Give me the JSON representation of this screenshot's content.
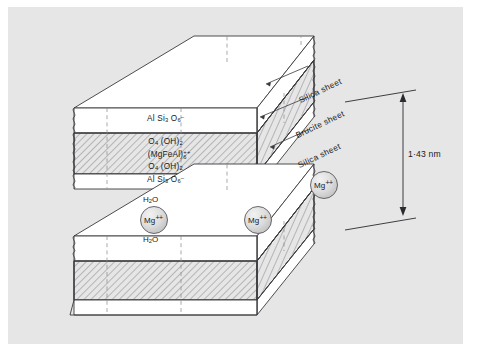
{
  "figure": {
    "background_color": "#e6e6e6",
    "line_color": "#3a3a3f",
    "hatch_color": "#6e6e73",
    "text_color": "#19191c"
  },
  "top_slab": {
    "layers": [
      {
        "id": "silica-upper",
        "fill": "white",
        "formula_lines": [
          "AlSi3O6-"
        ]
      },
      {
        "id": "brucite",
        "fill": "hatched",
        "formula_lines": [
          "O4(OH)2",
          "(MgFeAl)6++",
          "O4(OH)2"
        ]
      },
      {
        "id": "silica-lower",
        "fill": "white",
        "formula_lines": [
          "AlSi3O6-"
        ]
      }
    ],
    "formulas": {
      "silica_top": {
        "a": "Al Si",
        "a_sub": "3",
        "b": " O",
        "b_sub": "6",
        "b_sup": "–"
      },
      "brucite_line1": {
        "a": "O",
        "a_sub": "4",
        "b": " (OH)",
        "b_sub": "2"
      },
      "brucite_line2": {
        "a": "(MgFeAl)",
        "sub": "6",
        "sup": "++"
      },
      "brucite_line3": {
        "a": "O",
        "a_sub": "4",
        "b": " (OH)",
        "b_sub": "2"
      },
      "silica_bottom": {
        "a": "Al Si",
        "a_sub": "3",
        "b": " O",
        "b_sub": "6",
        "b_sup": "–"
      }
    }
  },
  "bottom_slab": {
    "layers": [
      {
        "id": "silica-upper",
        "fill": "white"
      },
      {
        "id": "brucite",
        "fill": "hatched"
      },
      {
        "id": "silica-lower",
        "fill": "white"
      }
    ]
  },
  "sheet_labels": [
    {
      "id": "silica-sheet-top",
      "text": "Silica sheet"
    },
    {
      "id": "brucite-sheet",
      "text": "Brucite sheet"
    },
    {
      "id": "silica-sheet-bottom",
      "text": "Silica sheet"
    }
  ],
  "dimension": {
    "label": "1·43 nm",
    "style": "double-headed vertical arrow"
  },
  "interlayer": {
    "ions": [
      {
        "id": "mg-ion-1",
        "symbol": "Mg",
        "charge": "++"
      },
      {
        "id": "mg-ion-2",
        "symbol": "Mg",
        "charge": "++"
      },
      {
        "id": "mg-ion-3",
        "symbol": "Mg",
        "charge": "++"
      }
    ],
    "water": [
      {
        "id": "water-above",
        "formula_a": "H",
        "formula_sub": "2",
        "formula_b": "O"
      },
      {
        "id": "water-below",
        "formula_a": "H",
        "formula_sub": "2",
        "formula_b": "O"
      }
    ],
    "vacancy_marker": {
      "id": "vacancy-circle",
      "style": "dashed"
    }
  }
}
